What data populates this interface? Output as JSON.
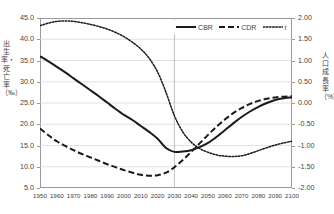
{
  "axes": {
    "left_title": "出生率・死亡率（‰）",
    "right_title": "人口成長率（%）",
    "left_ticks": [
      "45.0",
      "40.0",
      "35.0",
      "30.0",
      "25.0",
      "20.0",
      "15.0",
      "10.0",
      "5.0"
    ],
    "right_ticks": [
      "2.00",
      "1.50",
      "1.00",
      "0.50",
      "0.00",
      "-0.50",
      "-1.00",
      "-1.50",
      "-2.00"
    ],
    "x_ticks": [
      "1950",
      "1960",
      "1970",
      "1980",
      "1990",
      "2000",
      "2010",
      "2020",
      "2030",
      "2040",
      "2050",
      "2060",
      "2070",
      "2080",
      "2090",
      "2100"
    ]
  },
  "legend": {
    "items": [
      {
        "label": "CBR",
        "style": "solid",
        "color": "#1a1a1a"
      },
      {
        "label": "CDR",
        "style": "dashed",
        "color": "#1a1a1a"
      },
      {
        "label": "r",
        "style": "dotted",
        "color": "#1a1a1a"
      }
    ]
  },
  "chart_data": {
    "type": "line",
    "title": "",
    "xlabel": "",
    "ylabel": "出生率・死亡率（‰）",
    "y2label": "人口成長率（%）",
    "x": [
      1950,
      1955,
      1960,
      1965,
      1970,
      1975,
      1980,
      1985,
      1990,
      1995,
      2000,
      2005,
      2010,
      2015,
      2020,
      2025,
      2030,
      2035,
      2040,
      2045,
      2050,
      2055,
      2060,
      2065,
      2070,
      2075,
      2080,
      2085,
      2090,
      2095,
      2100
    ],
    "xlim": [
      1950,
      2100
    ],
    "ylim": [
      5.0,
      45.0
    ],
    "y2lim": [
      -2.0,
      2.0
    ],
    "grid": true,
    "legend_position": "top-right",
    "series": [
      {
        "name": "CBR",
        "axis": "left",
        "unit": "‰",
        "style": "solid",
        "values": [
          36.0,
          34.8,
          33.5,
          32.2,
          30.8,
          29.4,
          28.0,
          26.6,
          25.1,
          23.6,
          22.2,
          21.0,
          19.6,
          18.2,
          16.6,
          14.4,
          13.5,
          13.6,
          13.9,
          14.6,
          15.6,
          17.0,
          18.6,
          20.2,
          21.7,
          23.0,
          24.1,
          25.0,
          25.7,
          26.1,
          26.3
        ]
      },
      {
        "name": "CDR",
        "axis": "left",
        "unit": "‰",
        "style": "dashed",
        "values": [
          19.0,
          17.4,
          16.0,
          14.9,
          13.9,
          13.0,
          12.2,
          11.4,
          10.6,
          9.9,
          9.2,
          8.6,
          8.1,
          7.9,
          8.0,
          8.6,
          9.9,
          11.6,
          13.5,
          15.5,
          17.5,
          19.4,
          21.1,
          22.6,
          23.8,
          24.8,
          25.5,
          26.0,
          26.3,
          26.5,
          26.6
        ]
      },
      {
        "name": "r",
        "axis": "right",
        "unit": "%",
        "style": "dotted",
        "values": [
          1.82,
          1.88,
          1.92,
          1.93,
          1.92,
          1.89,
          1.85,
          1.8,
          1.74,
          1.66,
          1.56,
          1.43,
          1.27,
          1.05,
          0.73,
          0.25,
          -0.3,
          -0.68,
          -0.92,
          -1.07,
          -1.16,
          -1.22,
          -1.25,
          -1.26,
          -1.24,
          -1.19,
          -1.12,
          -1.05,
          -0.99,
          -0.94,
          -0.9
        ]
      }
    ]
  }
}
